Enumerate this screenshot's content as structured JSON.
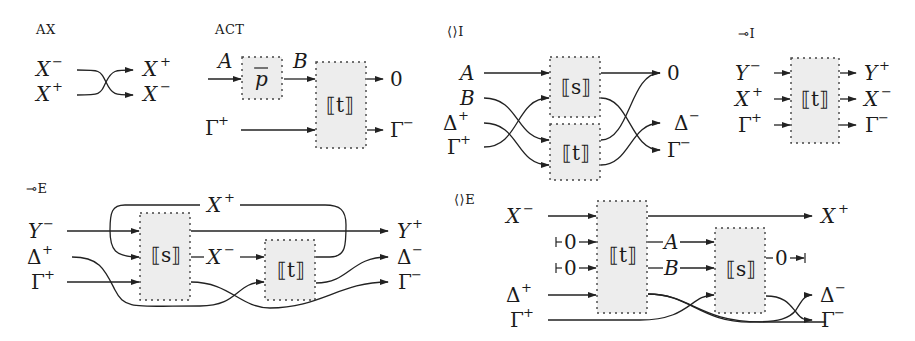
{
  "diagrams": [
    {
      "id": "ax",
      "rule_label": "AX",
      "inputs": [
        "X⁻",
        "X⁺"
      ],
      "outputs": [
        "X⁺",
        "X⁻"
      ],
      "wiring": "crossing"
    },
    {
      "id": "act",
      "rule_label": "ACT",
      "boxes": [
        {
          "label": "p̄"
        },
        {
          "label": "⟦t⟧"
        }
      ],
      "inputs": [
        "A",
        "Γ⁺"
      ],
      "intermediate": [
        "B"
      ],
      "outputs": [
        "0",
        "Γ⁻"
      ]
    },
    {
      "id": "tensor-intro",
      "rule_label": "⟨⟩I",
      "boxes": [
        {
          "label": "⟦s⟧"
        },
        {
          "label": "⟦t⟧"
        }
      ],
      "inputs": [
        "A",
        "B",
        "Δ⁺",
        "Γ⁺"
      ],
      "outputs": [
        "0",
        "Δ⁻",
        "Γ⁻"
      ]
    },
    {
      "id": "lollipop-intro",
      "rule_label": "⊸I",
      "boxes": [
        {
          "label": "⟦t⟧"
        }
      ],
      "inputs": [
        "Y⁻",
        "X⁺",
        "Γ⁺"
      ],
      "outputs": [
        "Y⁺",
        "X⁻",
        "Γ⁻"
      ]
    },
    {
      "id": "lollipop-elim",
      "rule_label": "⊸E",
      "boxes": [
        {
          "label": "⟦s⟧"
        },
        {
          "label": "⟦t⟧"
        }
      ],
      "inputs": [
        "Y⁻",
        "Δ⁺",
        "Γ⁺"
      ],
      "intermediate": [
        "X⁺",
        "X⁻"
      ],
      "outputs": [
        "Y⁺",
        "Δ⁻",
        "Γ⁻"
      ]
    },
    {
      "id": "tensor-elim",
      "rule_label": "⟨⟩E",
      "boxes": [
        {
          "label": "⟦t⟧"
        },
        {
          "label": "⟦s⟧"
        }
      ],
      "inputs": [
        "X⁻",
        "⊢0",
        "⊢0",
        "Δ⁺",
        "Γ⁺"
      ],
      "intermediate": [
        "A",
        "B"
      ],
      "outputs": [
        "X⁺",
        "0⊣",
        "Δ⁻",
        "Γ⁻"
      ]
    }
  ],
  "text": {
    "ax_label": "AX",
    "act_label": "ACT",
    "ti_label": "⟨⟩I",
    "li_label": "⊸I",
    "le_label": "⊸E",
    "te_label": "⟨⟩E",
    "X": "X",
    "Y": "Y",
    "A": "A",
    "B": "B",
    "Gamma": "Γ",
    "Delta": "Δ",
    "zero": "0",
    "plus": "+",
    "minus": "−",
    "pbar": "p",
    "s_box": "⟦s⟧",
    "t_box": "⟦t⟧",
    "t_inner": "t",
    "s_inner": "s"
  }
}
